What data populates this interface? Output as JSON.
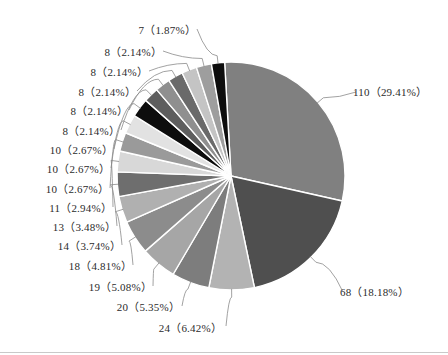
{
  "chart_data": {
    "type": "pie",
    "title": "",
    "total": 374,
    "legend_position": "none",
    "grid": false,
    "label_format": "{value}（{percent}%）",
    "start_angle_deg": -93.2,
    "direction": "clockwise",
    "categories": [
      "110",
      "68",
      "24",
      "20",
      "19",
      "18",
      "14",
      "13",
      "11",
      "10",
      "10",
      "10",
      "8",
      "8",
      "8",
      "8",
      "8",
      "7"
    ],
    "values": [
      110,
      68,
      24,
      20,
      19,
      18,
      14,
      13,
      11,
      10,
      10,
      10,
      8,
      8,
      8,
      8,
      8,
      7
    ],
    "percents": [
      29.41,
      18.18,
      6.42,
      5.35,
      5.08,
      4.81,
      3.74,
      3.48,
      2.94,
      2.67,
      2.67,
      2.67,
      2.14,
      2.14,
      2.14,
      2.14,
      2.14,
      1.87
    ],
    "colors": [
      "#808080",
      "#4f4f4f",
      "#b3b3b3",
      "#7d7d7d",
      "#a6a6a6",
      "#8c8c8c",
      "#b0b0b0",
      "#6e6e6e",
      "#d8d8d8",
      "#9a9a9a",
      "#e2e2e2",
      "#0d0d0d",
      "#5e5e5e",
      "#8f8f8f",
      "#6a6a6a",
      "#c4c4c4",
      "#9e9e9e",
      "#0d0d0d"
    ],
    "slices": [
      {
        "value": 110,
        "percent": 29.41,
        "label": "110（29.41%）",
        "color": "#808080"
      },
      {
        "value": 68,
        "percent": 18.18,
        "label": "68（18.18%）",
        "color": "#4f4f4f"
      },
      {
        "value": 24,
        "percent": 6.42,
        "label": "24（6.42%）",
        "color": "#b3b3b3"
      },
      {
        "value": 20,
        "percent": 5.35,
        "label": "20（5.35%）",
        "color": "#7d7d7d"
      },
      {
        "value": 19,
        "percent": 5.08,
        "label": "19（5.08%）",
        "color": "#a6a6a6"
      },
      {
        "value": 18,
        "percent": 4.81,
        "label": "18（4.81%）",
        "color": "#8c8c8c"
      },
      {
        "value": 14,
        "percent": 3.74,
        "label": "14（3.74%）",
        "color": "#b0b0b0"
      },
      {
        "value": 13,
        "percent": 3.48,
        "label": "13（3.48%）",
        "color": "#6e6e6e"
      },
      {
        "value": 11,
        "percent": 2.94,
        "label": "11（2.94%）",
        "color": "#d8d8d8"
      },
      {
        "value": 10,
        "percent": 2.67,
        "label": "10（2.67%）",
        "color": "#9a9a9a"
      },
      {
        "value": 10,
        "percent": 2.67,
        "label": "10（2.67%）",
        "color": "#e2e2e2"
      },
      {
        "value": 10,
        "percent": 2.67,
        "label": "10（2.67%）",
        "color": "#0d0d0d"
      },
      {
        "value": 8,
        "percent": 2.14,
        "label": "8（2.14%）",
        "color": "#5e5e5e"
      },
      {
        "value": 8,
        "percent": 2.14,
        "label": "8（2.14%）",
        "color": "#8f8f8f"
      },
      {
        "value": 8,
        "percent": 2.14,
        "label": "8（2.14%）",
        "color": "#6a6a6a"
      },
      {
        "value": 8,
        "percent": 2.14,
        "label": "8（2.14%）",
        "color": "#c4c4c4"
      },
      {
        "value": 8,
        "percent": 2.14,
        "label": "8（2.14%）",
        "color": "#9e9e9e"
      },
      {
        "value": 7,
        "percent": 1.87,
        "label": "7（1.87%）",
        "color": "#0d0d0d"
      }
    ]
  },
  "labels": {
    "l0": "7（1.87%）",
    "l1": "8（2.14%）",
    "l2": "8（2.14%）",
    "l3": "8（2.14%）",
    "l4": "8（2.14%）",
    "l5": "8（2.14%）",
    "l6": "10（2.67%）",
    "l7": "10（2.67%）",
    "l8": "10（2.67%）",
    "l9": "11（2.94%）",
    "l10": "13（3.48%）",
    "l11": "14（3.74%）",
    "l12": "18（4.81%）",
    "l13": "19（5.08%）",
    "l14": "20（5.35%）",
    "l15": "24（6.42%）",
    "l16": "110（29.41%）",
    "l17": "68（18.18%）"
  }
}
